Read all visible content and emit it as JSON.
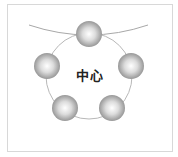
{
  "diagram": {
    "center_label": "中心",
    "node_count": 5,
    "colors": {
      "frame": "#d8d8d8",
      "ring": "#b8b8b8",
      "curve": "#a8a8a8",
      "sphere_light": "#ffffff",
      "sphere_dark": "#8a8a8a",
      "text": "#222222"
    }
  }
}
